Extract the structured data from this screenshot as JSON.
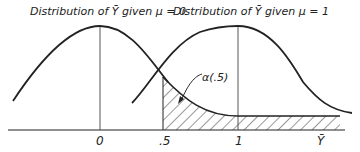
{
  "labels": {
    "left_title": "Distribution of Ȳ given μ = 0",
    "right_title": "Distribution of Ȳ given μ = 1",
    "alpha": "α(.5)",
    "x_axis_var": "Ȳ"
  },
  "ticks": [
    "0",
    ".5",
    "1"
  ],
  "colors": {
    "line": "#222222",
    "hatch": "#333333",
    "background": "#ffffff"
  }
}
